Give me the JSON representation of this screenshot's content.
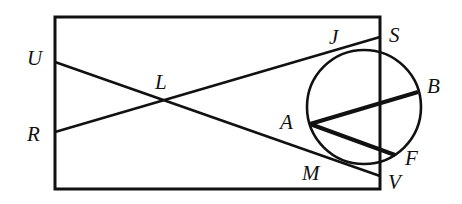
{
  "diagram": {
    "type": "geometry",
    "stroke_color": "#111111",
    "rectangle": {
      "x1": 55,
      "y1": 17,
      "x2": 380,
      "y2": 189
    },
    "circle": {
      "cx": 364,
      "cy": 107,
      "r": 57
    },
    "points": {
      "U": {
        "x": 55,
        "y": 62
      },
      "R": {
        "x": 55,
        "y": 132
      },
      "L": {
        "x": 166,
        "y": 101
      },
      "S": {
        "x": 380,
        "y": 37
      },
      "J": {
        "x": 340,
        "y": 50
      },
      "B": {
        "x": 418,
        "y": 92
      },
      "A": {
        "x": 310,
        "y": 124
      },
      "F": {
        "x": 395,
        "y": 155
      },
      "M": {
        "x": 345,
        "y": 164
      },
      "V": {
        "x": 380,
        "y": 176
      }
    },
    "segments": [
      {
        "from": "U",
        "to": "V"
      },
      {
        "from": "R",
        "to": "S"
      },
      {
        "from": "A",
        "to": "B"
      },
      {
        "from": "A",
        "to": "F"
      }
    ],
    "labels": [
      {
        "text": "U",
        "x": 27,
        "y": 48
      },
      {
        "text": "L",
        "x": 155,
        "y": 72
      },
      {
        "text": "R",
        "x": 27,
        "y": 124
      },
      {
        "text": "J",
        "x": 329,
        "y": 27
      },
      {
        "text": "S",
        "x": 389,
        "y": 25
      },
      {
        "text": "B",
        "x": 427,
        "y": 76
      },
      {
        "text": "A",
        "x": 280,
        "y": 112
      },
      {
        "text": "F",
        "x": 405,
        "y": 148
      },
      {
        "text": "M",
        "x": 302,
        "y": 163
      },
      {
        "text": "V",
        "x": 388,
        "y": 172
      }
    ]
  }
}
